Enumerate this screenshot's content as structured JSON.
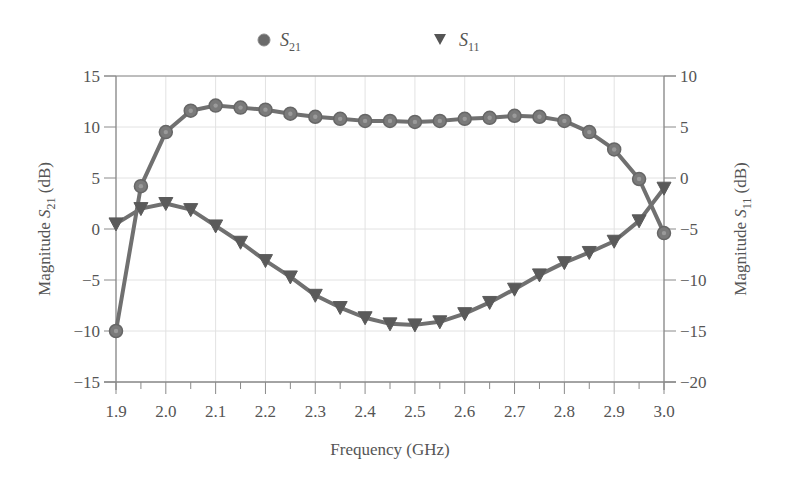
{
  "chart_data": {
    "type": "line",
    "title": "",
    "xlabel": "Frequency (GHz)",
    "ylabel": "Magnitude S21 (dB)",
    "ylabel_right": "Magnitude S11 (dB)",
    "xlim": [
      1.9,
      3.0
    ],
    "ylim": [
      -15,
      15
    ],
    "ylim_right": [
      -20,
      10
    ],
    "x_ticks": [
      "1.9",
      "2.0",
      "2.1",
      "2.2",
      "2.3",
      "2.4",
      "2.5",
      "2.6",
      "2.7",
      "2.8",
      "2.9",
      "3.0"
    ],
    "y_ticks": [
      "15",
      "10",
      "5",
      "0",
      "−5",
      "−10",
      "−15"
    ],
    "y_ticks_right": [
      "10",
      "5",
      "0",
      "−5",
      "−10",
      "−15",
      "−20"
    ],
    "grid": true,
    "legend_position": "top",
    "x": [
      1.9,
      1.95,
      2.0,
      2.05,
      2.1,
      2.15,
      2.2,
      2.25,
      2.3,
      2.35,
      2.4,
      2.45,
      2.5,
      2.55,
      2.6,
      2.65,
      2.7,
      2.75,
      2.8,
      2.85,
      2.9,
      2.95,
      3.0
    ],
    "series": [
      {
        "name": "S21",
        "axis": "left",
        "marker": "circle",
        "values": [
          -10.0,
          4.2,
          9.5,
          11.6,
          12.1,
          11.9,
          11.7,
          11.3,
          11.0,
          10.8,
          10.6,
          10.6,
          10.5,
          10.6,
          10.8,
          10.9,
          11.1,
          11.0,
          10.6,
          9.5,
          7.8,
          4.9,
          -0.4
        ]
      },
      {
        "name": "S11",
        "axis": "right",
        "marker": "triangle-down",
        "values": [
          -4.5,
          -3.0,
          -2.5,
          -3.1,
          -4.7,
          -6.3,
          -8.1,
          -9.7,
          -11.5,
          -12.7,
          -13.7,
          -14.3,
          -14.4,
          -14.1,
          -13.3,
          -12.2,
          -10.9,
          -9.5,
          -8.3,
          -7.3,
          -6.2,
          -4.2,
          -1.0
        ]
      }
    ]
  },
  "legend": {
    "s21": {
      "main": "S",
      "sub": "21"
    },
    "s11": {
      "main": "S",
      "sub": "11"
    }
  },
  "labels": {
    "xlabel": "Frequency (GHz)",
    "ylabel_left_prefix": "Magnitude ",
    "ylabel_left_main": "S",
    "ylabel_left_sub": "21",
    "ylabel_left_suffix": " (dB)",
    "ylabel_right_prefix": "Magnitude ",
    "ylabel_right_main": "S",
    "ylabel_right_sub": "11",
    "ylabel_right_suffix": " (dB)"
  },
  "colors": {
    "series": "#707070",
    "marker_fill": "#7a7a7a",
    "axis": "#8a8a8a",
    "grid": "#e2e2e2",
    "text": "#555555"
  }
}
